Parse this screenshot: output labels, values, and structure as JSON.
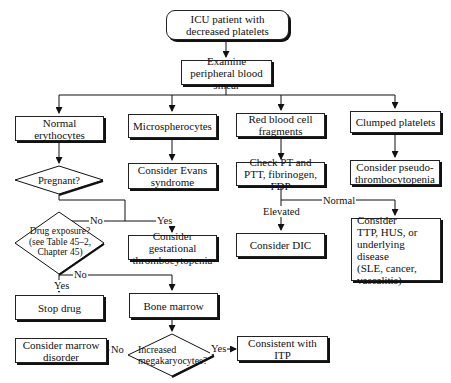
{
  "flowchart": {
    "start": "ICU patient with decreased platelets",
    "examine": "Examine peripheral blood smear",
    "branches": {
      "normal_erythrocytes": "Normal erythocytes",
      "microspherocytes": "Microspherocytes",
      "rbc_fragments": "Red blood cell fragments",
      "clumped_platelets": "Clumped platelets"
    },
    "pregnant": "Pregnant?",
    "evans": "Consider Evans syndrome",
    "check_pt": "Check PT and PTT, fibrinogen, FDP",
    "pseudo": "Consider pseudo-\nthrombocytopenia",
    "gestational": "Consider gestational thrombocytopenia",
    "drug_exposure": "Drug exposure?\n(see Table 45–2,\nChapter 45)",
    "dic": "Consider DIC",
    "ttp": "Consider\n    TTP, HUS, or\n    underlying disease\n    (SLE, cancer,\n    vascalitis)",
    "stop_drug": "Stop drug",
    "bone_marrow": "Bone marrow",
    "megakaryocytes": "Increased\nmegakaryocytes?",
    "marrow_disorder": "Consider marrow\ndisorder",
    "itp": "Consistent with ITP",
    "edge_labels": {
      "no": "No",
      "yes": "Yes",
      "elevated": "Elevated",
      "normal": "Normal"
    }
  }
}
